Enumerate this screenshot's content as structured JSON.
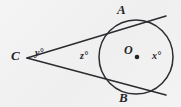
{
  "figure": {
    "kind": "geometry-diagram",
    "topic": "circle-with-two-tangents-from-external-point",
    "background_color": "#f1f1f1",
    "ink_color": "#2b2b30"
  },
  "labels": {
    "point_a": "A",
    "point_b": "B",
    "point_c": "C",
    "center_o": "O",
    "angle_x": "x°",
    "angle_y": "y°",
    "angle_z": "z°"
  },
  "geometry": {
    "circle": {
      "cx": 136,
      "cy": 57,
      "r": 37
    },
    "center_dot": {
      "cx": 137,
      "cy": 57,
      "r": 2.2
    },
    "external_point": {
      "x": 27,
      "y": 58
    },
    "tangent_point_a": {
      "x": 131,
      "y": 24
    },
    "tangent_point_b": {
      "x": 130,
      "y": 90
    },
    "tangent_upper_end": {
      "x": 166,
      "y": 16
    },
    "tangent_lower_end": {
      "x": 166,
      "y": 95
    }
  }
}
